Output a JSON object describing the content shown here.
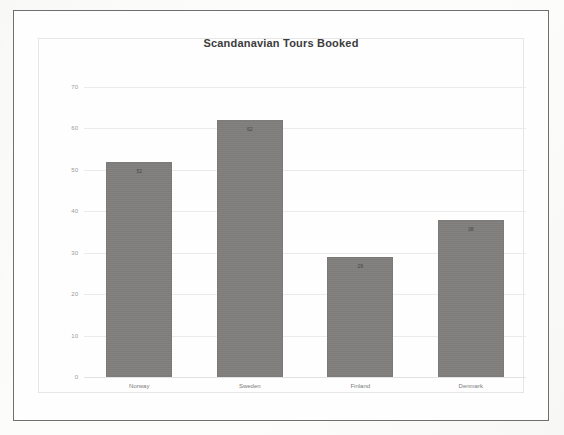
{
  "chart_data": {
    "type": "bar",
    "title": "Scandanavian Tours Booked",
    "categories": [
      "Norway",
      "Sweden",
      "Finland",
      "Denmark"
    ],
    "values": [
      52,
      62,
      29,
      38
    ],
    "xlabel": "",
    "ylabel": "",
    "ylim": [
      0,
      70
    ],
    "ytick_step": 10,
    "yticks": [
      "0",
      "10",
      "20",
      "30",
      "40",
      "50",
      "60",
      "70"
    ],
    "grid": true,
    "legend": "none",
    "data_labels_shown": true,
    "bar_color": "#7f7e7c",
    "gridline_color": "#ebebeb",
    "title_color": "#3c3c3c",
    "tick_label_color": "#9a9a9a",
    "category_label_color": "#7a7a7a"
  },
  "frame": {
    "outer_border_color": "#6f6f70",
    "inner_border_color": "#e6e6e6",
    "page_background": "#fdfdfc"
  }
}
